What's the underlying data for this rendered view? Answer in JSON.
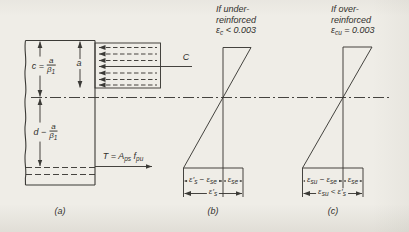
{
  "colors": {
    "background": "#efede7",
    "ink": "#3b3a36",
    "text": "#31302c"
  },
  "figure_a": {
    "label": "(a)",
    "dim_neutral_axis": {
      "prefix": "c =",
      "numerator": "a",
      "denominator": "β_{1}"
    },
    "dim_steel_depth": {
      "prefix": "d −",
      "numerator": "a",
      "denominator": "β_{1}"
    },
    "dim_stress_block": "a",
    "compression_resultant": "C",
    "tension_resultant": "T = A_{ps} f_{pu}"
  },
  "figure_b": {
    "label": "(b)",
    "caption": {
      "line1": "If under-",
      "line2": "reinforced",
      "line3": "ε_{c} < 0.003"
    },
    "dims": {
      "left": "ε′_{s} − ε_{se}",
      "right": "ε_{se}",
      "total": "ε′_{s}"
    }
  },
  "figure_c": {
    "label": "(c)",
    "caption": {
      "line1": "If over-",
      "line2": "reinforced",
      "line3": "ε_{cu} = 0.003"
    },
    "dims": {
      "left": "ε_{su} − ε_{se}",
      "right": "ε_{se}",
      "total": "ε_{su} < ε′_{s}"
    }
  }
}
